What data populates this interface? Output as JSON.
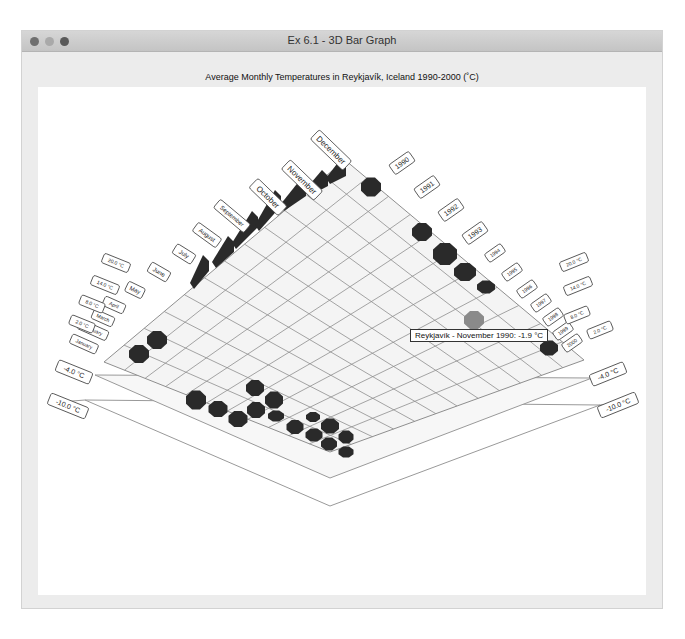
{
  "window": {
    "title": "Ex 6.1 - 3D Bar Graph",
    "controls": [
      "close",
      "minimize",
      "maximize"
    ]
  },
  "tooltip": {
    "text": "Reykjavík - November 1990: -1.9 °C"
  },
  "chart_data": {
    "type": "bar3d",
    "title": "Average Monthly Temperatures in Reykjavík, Iceland 1990-2000 (˚C)",
    "xlabel": "Month",
    "ylabel": "Year",
    "zlabel": "Temperature (°C)",
    "months": [
      "January",
      "February",
      "March",
      "April",
      "May",
      "June",
      "July",
      "August",
      "September",
      "October",
      "November",
      "December"
    ],
    "years": [
      "1990",
      "1991",
      "1992",
      "1993",
      "1994",
      "1995",
      "1996",
      "1997",
      "1998",
      "1999",
      "2000"
    ],
    "z_ticks_left": [
      "-10.0 °C",
      "-4.0 °C",
      "2.0 °C",
      "8.0 °C",
      "14.0 °C",
      "20.0 °C"
    ],
    "z_ticks_right": [
      "-10.0 °C",
      "-4.0 °C",
      "2.0 °C",
      "8.0 °C",
      "14.0 °C",
      "20.0 °C"
    ],
    "zlim": [
      -10,
      20
    ],
    "highlighted": {
      "month": "November",
      "year": "1990",
      "value": -1.9
    }
  },
  "labels": {
    "month_labels": [
      "January",
      "February",
      "March",
      "April",
      "May",
      "June",
      "July",
      "August",
      "September",
      "October",
      "November",
      "December"
    ],
    "year_labels": [
      "1990",
      "1991",
      "1992",
      "1993",
      "1994",
      "1995",
      "1996",
      "1997",
      "1998",
      "1999",
      "2000"
    ],
    "temp_left": [
      "20.0 °C",
      "14.0 °C",
      "8.0 °C",
      "2.0 °C",
      "-4.0 °C",
      "-10.0 °C"
    ],
    "temp_right": [
      "20.0 °C",
      "14.0 °C",
      "8.0 °C",
      "2.0 °C",
      "-4.0 °C",
      "-10.0 °C"
    ]
  },
  "colors": {
    "bar": "#2a2a2a",
    "bar_highlight": "#8a8a8a",
    "grid": "#8e8e8e",
    "floor": "#f4f4f4",
    "plate": "#f6f6f6"
  }
}
